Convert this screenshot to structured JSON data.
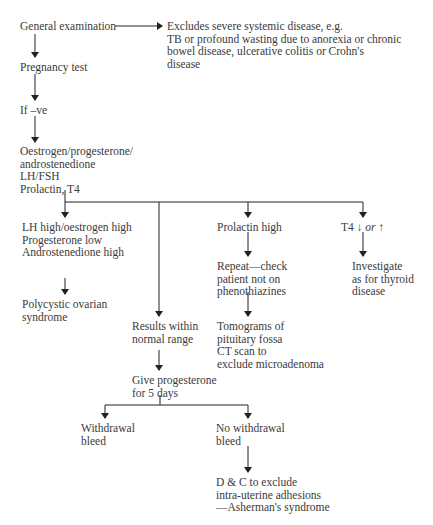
{
  "diagram": {
    "type": "flowchart",
    "nodes": {
      "general_exam": {
        "lines": [
          "General examination"
        ]
      },
      "excludes": {
        "lines": [
          "Excludes severe systemic disease, e.g.",
          "TB or profound wasting due to anorexia or chronic",
          "bowel disease, ulcerative colitis or Crohn's",
          "disease"
        ]
      },
      "pregnancy_test": {
        "lines": [
          "Pregnancy test"
        ]
      },
      "if_neg": {
        "lines": [
          "If –ve"
        ]
      },
      "hormones": {
        "lines": [
          "Oestrogen/progesterone/",
          "androstenedione",
          "LH/FSH",
          "Prolactin, T4"
        ]
      },
      "lh_high": {
        "lines": [
          "LH high/oestrogen high",
          "Progesterone low",
          "Androstenedione high"
        ]
      },
      "pcos": {
        "lines": [
          "Polycystic ovarian",
          "syndrome"
        ]
      },
      "prolactin_high": {
        "lines": [
          "Prolactin high"
        ]
      },
      "repeat": {
        "lines": [
          "Repeat—check",
          "patient not on",
          "phenothiazines"
        ]
      },
      "t4": {
        "prefix": "T4",
        "down_arrow": "↓",
        "or": "or",
        "up_arrow": "↑"
      },
      "thyroid": {
        "lines": [
          "Investigate",
          "as for thyroid",
          "disease"
        ]
      },
      "normal": {
        "lines": [
          "Results within",
          "normal range"
        ]
      },
      "tomograms": {
        "lines": [
          "Tomograms of",
          "pituitary fossa",
          "CT scan to",
          "exclude microadenoma"
        ]
      },
      "progesterone": {
        "lines": [
          "Give progesterone",
          "for 5 days"
        ]
      },
      "withdrawal": {
        "lines": [
          "Withdrawal",
          "bleed"
        ]
      },
      "no_withdrawal": {
        "lines": [
          "No withdrawal",
          "bleed"
        ]
      },
      "dc": {
        "lines": [
          "D & C to exclude",
          "intra-uterine adhesions",
          "—Asherman's syndrome"
        ]
      }
    },
    "edges": [
      [
        "general_exam",
        "excludes"
      ],
      [
        "general_exam",
        "pregnancy_test"
      ],
      [
        "pregnancy_test",
        "if_neg"
      ],
      [
        "if_neg",
        "hormones"
      ],
      [
        "hormones",
        "lh_high"
      ],
      [
        "hormones",
        "normal"
      ],
      [
        "hormones",
        "prolactin_high"
      ],
      [
        "hormones",
        "t4"
      ],
      [
        "lh_high",
        "pcos"
      ],
      [
        "prolactin_high",
        "repeat"
      ],
      [
        "repeat",
        "tomograms"
      ],
      [
        "t4",
        "thyroid"
      ],
      [
        "normal",
        "progesterone"
      ],
      [
        "progesterone",
        "withdrawal"
      ],
      [
        "progesterone",
        "no_withdrawal"
      ],
      [
        "no_withdrawal",
        "dc"
      ]
    ],
    "colors": {
      "text": "#3a3a3a",
      "line": "#222222"
    }
  }
}
